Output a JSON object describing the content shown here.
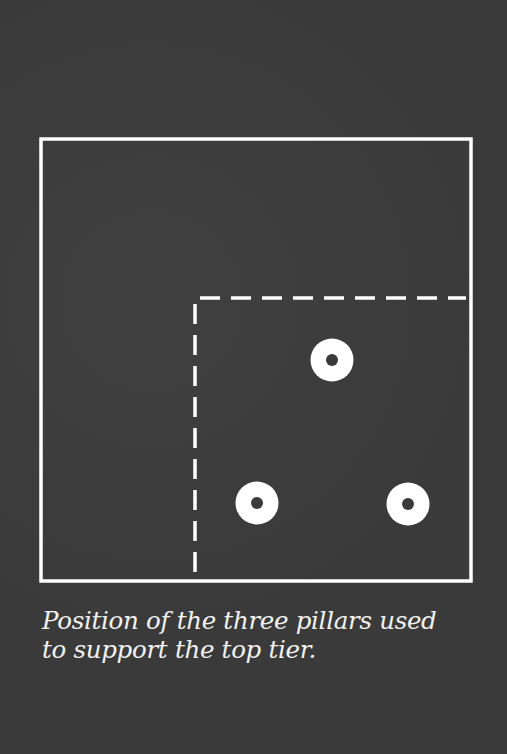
{
  "caption": {
    "line1": "Position of the three pillars used",
    "line2": "to support the top tier."
  },
  "diagram": {
    "background_color": "#3a3a3a",
    "line_color": "#ffffff",
    "outer_square": {
      "x": 41,
      "y": 139,
      "width": 430,
      "height": 442
    },
    "top_tier_outline": {
      "corner_x": 195,
      "corner_y": 298,
      "right_x": 466,
      "bottom_y": 572,
      "style": "dashed"
    },
    "pillars": [
      {
        "name": "top-pillar",
        "cx": 332,
        "cy": 360
      },
      {
        "name": "bottom-left-pillar",
        "cx": 257,
        "cy": 503
      },
      {
        "name": "bottom-right-pillar",
        "cx": 408,
        "cy": 504
      }
    ]
  }
}
